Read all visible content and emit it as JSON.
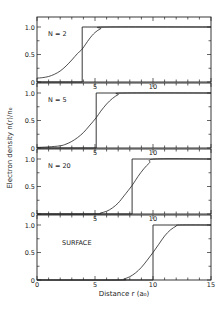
{
  "chart_data": {
    "type": "line",
    "title": "",
    "xlabel": "Distance r (a₀)",
    "ylabel": "Electron density n(r)/n₀",
    "xlim": [
      0,
      15
    ],
    "ylim": [
      0,
      1.0
    ],
    "x_ticks": [
      0,
      5,
      10,
      15
    ],
    "x_tick_labels": [
      "0",
      "5",
      "10",
      "15"
    ],
    "y_ticks": [
      0,
      0.5,
      1.0
    ],
    "y_tick_labels": [
      "0",
      "0.5",
      "1.0"
    ],
    "grid": false,
    "layout": "4 stacked panels sharing x-axis",
    "panels": [
      {
        "label": "N = 2",
        "step_edge": 3.9,
        "series": [
          {
            "name": "step (jellium edge)",
            "x": [
              0,
              3.9,
              3.9,
              15
            ],
            "y": [
              0,
              0,
              1.0,
              1.0
            ]
          },
          {
            "name": "density",
            "x": [
              0,
              0.5,
              1.0,
              1.5,
              2.0,
              2.5,
              3.0,
              3.5,
              3.9,
              4.5,
              5.0,
              5.5,
              6.0,
              15
            ],
            "y": [
              0.07,
              0.08,
              0.1,
              0.14,
              0.2,
              0.29,
              0.4,
              0.52,
              0.6,
              0.78,
              0.9,
              0.97,
              1.0,
              1.0
            ]
          }
        ]
      },
      {
        "label": "N = 5",
        "step_edge": 5.1,
        "series": [
          {
            "name": "step (jellium edge)",
            "x": [
              0,
              5.1,
              5.1,
              15
            ],
            "y": [
              0,
              0,
              1.0,
              1.0
            ]
          },
          {
            "name": "density",
            "x": [
              0,
              1.0,
              2.0,
              2.5,
              3.0,
              3.5,
              4.0,
              4.5,
              5.1,
              5.5,
              6.0,
              6.5,
              7.0,
              7.5,
              15
            ],
            "y": [
              0.01,
              0.02,
              0.04,
              0.07,
              0.12,
              0.19,
              0.28,
              0.4,
              0.55,
              0.67,
              0.8,
              0.9,
              0.97,
              1.0,
              1.0
            ]
          }
        ]
      },
      {
        "label": "N = 20",
        "step_edge": 8.2,
        "series": [
          {
            "name": "step (jellium edge)",
            "x": [
              0,
              8.2,
              8.2,
              15
            ],
            "y": [
              0,
              0,
              1.0,
              1.0
            ]
          },
          {
            "name": "density",
            "x": [
              0,
              5.0,
              5.5,
              6.0,
              6.5,
              7.0,
              7.5,
              8.2,
              8.7,
              9.2,
              9.7,
              10.2,
              15
            ],
            "y": [
              0,
              0.0,
              0.02,
              0.05,
              0.11,
              0.2,
              0.33,
              0.52,
              0.68,
              0.82,
              0.93,
              1.0,
              1.0
            ]
          }
        ]
      },
      {
        "label": "SURFACE",
        "step_edge": 10.0,
        "series": [
          {
            "name": "step (jellium edge)",
            "x": [
              0,
              10.0,
              10.0,
              15
            ],
            "y": [
              0,
              0,
              1.0,
              1.0
            ]
          },
          {
            "name": "density",
            "x": [
              0,
              7.0,
              7.5,
              8.0,
              8.5,
              9.0,
              9.5,
              10.0,
              10.5,
              11.0,
              11.5,
              12.0,
              12.3,
              15
            ],
            "y": [
              0,
              0.0,
              0.02,
              0.06,
              0.13,
              0.23,
              0.36,
              0.5,
              0.65,
              0.8,
              0.91,
              0.98,
              1.0,
              1.0
            ]
          }
        ]
      }
    ]
  }
}
